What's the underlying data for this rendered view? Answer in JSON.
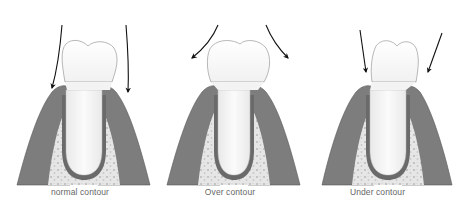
{
  "diagram": {
    "panels": [
      {
        "id": "normal",
        "caption": "normal contour",
        "arrow_direction": "down-into-sulcus"
      },
      {
        "id": "over",
        "caption": "Over contour",
        "arrow_direction": "deflected-outward"
      },
      {
        "id": "under",
        "caption": "Under contour",
        "arrow_direction": "impacting-gingiva"
      }
    ],
    "colors": {
      "gingiva": "#7a7a7a",
      "gingiva_light": "#a8a8a8",
      "bone": "#e6e6e6",
      "bone_spots": "#bdbdbd",
      "tooth": "#fafafa",
      "tooth_outline": "#9a9a9a",
      "arrow": "#111111",
      "caption": "#666666"
    }
  }
}
